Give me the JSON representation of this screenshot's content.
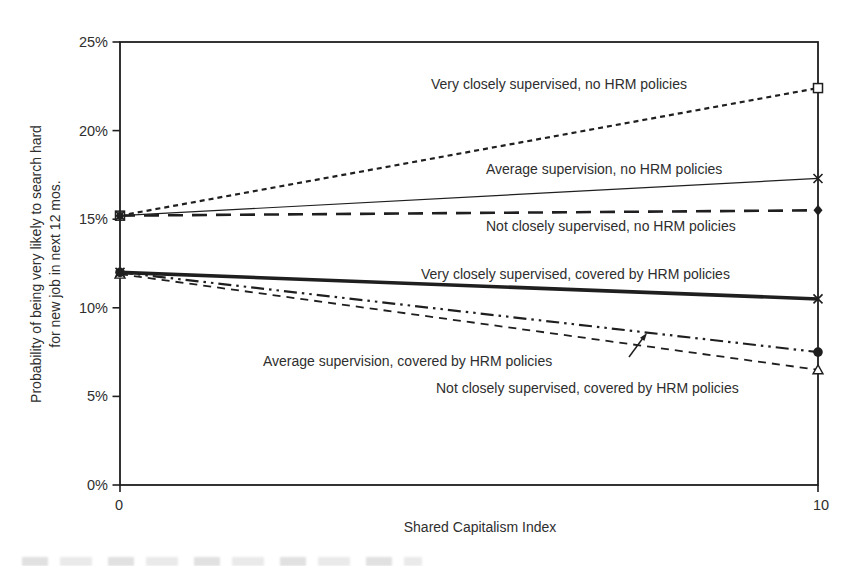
{
  "chart_data": {
    "type": "line",
    "title": "",
    "xlabel": "Shared Capitalism Index",
    "ylabel_lines": [
      "Probability of being very likely to search hard",
      "for new job in next 12 mos."
    ],
    "xlim": [
      0,
      10
    ],
    "ylim": [
      0,
      25
    ],
    "grid": false,
    "legend_position": "inline-labels",
    "x": [
      0,
      10
    ],
    "x_ticks": [
      {
        "value": 0,
        "label": "0"
      },
      {
        "value": 10,
        "label": "10"
      }
    ],
    "y_ticks": [
      {
        "value": 0,
        "label": "0%"
      },
      {
        "value": 5,
        "label": "5%"
      },
      {
        "value": 10,
        "label": "10%"
      },
      {
        "value": 15,
        "label": "15%"
      },
      {
        "value": 20,
        "label": "20%"
      },
      {
        "value": 25,
        "label": "25%"
      }
    ],
    "series": [
      {
        "name": "Very closely supervised, no HRM policies",
        "values": [
          15.2,
          22.4
        ],
        "line_style": "short-dash",
        "marker": "open-square"
      },
      {
        "name": "Average supervision, no HRM policies",
        "values": [
          15.2,
          17.3
        ],
        "line_style": "thin-solid",
        "marker": "x"
      },
      {
        "name": "Not closely supervised, no HRM policies",
        "values": [
          15.2,
          15.5
        ],
        "line_style": "long-dash",
        "marker": "filled-diamond"
      },
      {
        "name": "Very closely supervised, covered by HRM policies",
        "values": [
          12.0,
          10.5
        ],
        "line_style": "thick-solid",
        "marker": "x"
      },
      {
        "name": "Average supervision, covered by HRM policies",
        "values": [
          12.0,
          7.5
        ],
        "line_style": "dash-dot-dot",
        "marker": "filled-circle"
      },
      {
        "name": "Not closely supervised, covered by HRM policies",
        "values": [
          11.9,
          6.5
        ],
        "line_style": "medium-dash",
        "marker": "open-triangle"
      }
    ],
    "series_labels": [
      {
        "series": 0,
        "x": 431,
        "y": 89,
        "anchor": "start"
      },
      {
        "series": 1,
        "x": 486,
        "y": 174,
        "anchor": "start"
      },
      {
        "series": 2,
        "x": 486,
        "y": 231,
        "anchor": "start"
      },
      {
        "series": 3,
        "x": 421,
        "y": 279,
        "anchor": "start"
      },
      {
        "series": 4,
        "x": 263,
        "y": 366,
        "anchor": "start"
      },
      {
        "series": 5,
        "x": 436,
        "y": 393,
        "anchor": "start"
      }
    ],
    "annotation_arrow": {
      "x1": 629,
      "y1": 357,
      "x2": 647,
      "y2": 333
    },
    "colors": {
      "ink": "#1f1f1f",
      "text": "#2e2e2e",
      "background": "#ffffff"
    }
  }
}
